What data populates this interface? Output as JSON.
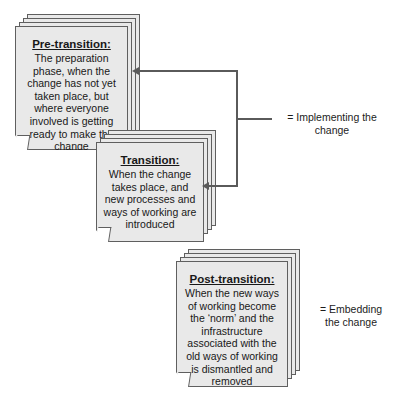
{
  "diagram": {
    "background_color": "#ffffff",
    "card_fill_color": "#e9e9e9",
    "card_border_color": "#5f5f5f",
    "connector_color": "#5a5a5a",
    "cards": [
      {
        "id": "pre-transition",
        "title": "Pre-transition:",
        "text": "The preparation phase, when the change has not yet taken place, but where everyone involved is getting ready to make the change"
      },
      {
        "id": "transition",
        "title": "Transition:",
        "text": "When the change takes place, and new processes and ways of working are introduced"
      },
      {
        "id": "post-transition",
        "title": "Post-transition:",
        "text": "When the new ways of working become the ‘norm’ and the infrastructure associated with the old ways of working is dismantled and removed"
      }
    ],
    "legends": [
      {
        "id": "implementing",
        "text": "= Implementing the change"
      },
      {
        "id": "embedding",
        "text": "= Embedding the change"
      }
    ]
  }
}
